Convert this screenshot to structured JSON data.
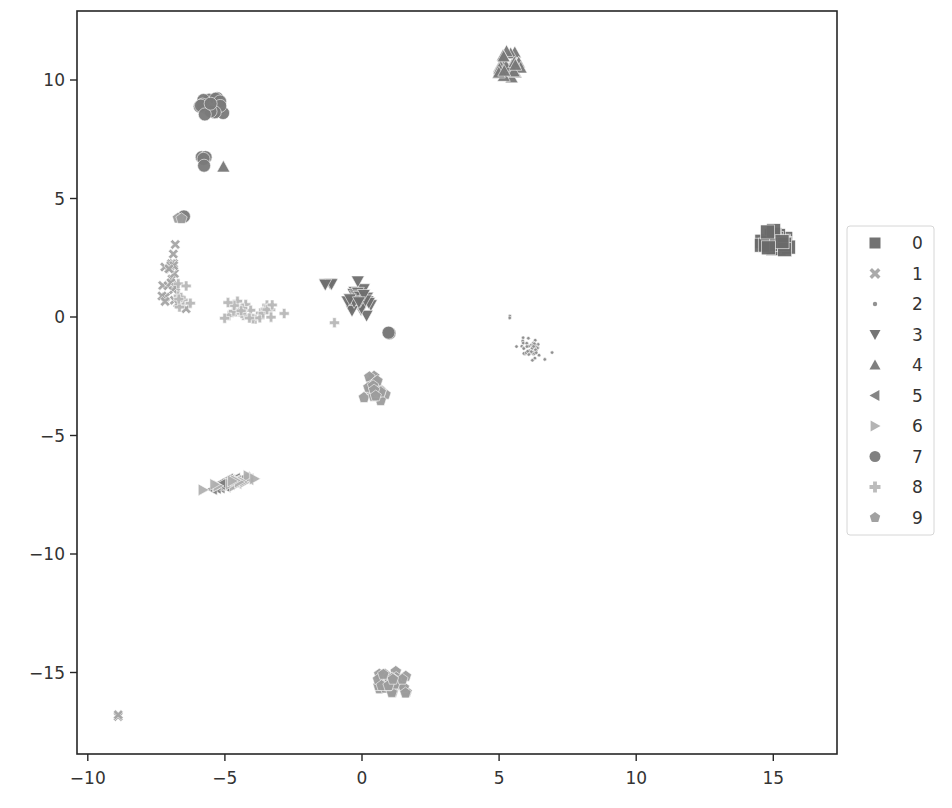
{
  "chart_data": {
    "type": "scatter",
    "title": "",
    "xlabel": "",
    "ylabel": "",
    "xlim": [
      -10.5,
      17.2
    ],
    "ylim": [
      -18.5,
      12.9
    ],
    "x_ticks": [
      -10,
      -5,
      0,
      5,
      10,
      15
    ],
    "x_tick_labels": [
      "−10",
      "−5",
      "0",
      "5",
      "10",
      "15"
    ],
    "y_ticks": [
      -15,
      -10,
      -5,
      0,
      5,
      10
    ],
    "y_tick_labels": [
      "−15",
      "−10",
      "−5",
      "0",
      "5",
      "10"
    ],
    "grid": false,
    "legend_position": "outside right, vertically centered",
    "legend": [
      {
        "label": "0",
        "marker": "square",
        "color": "#6a6a6a"
      },
      {
        "label": "1",
        "marker": "x",
        "color": "#a5a5a5"
      },
      {
        "label": "2",
        "marker": "dot",
        "color": "#8c8c8c"
      },
      {
        "label": "3",
        "marker": "triangle-down",
        "color": "#6e6e6e"
      },
      {
        "label": "4",
        "marker": "triangle-up",
        "color": "#787878"
      },
      {
        "label": "5",
        "marker": "triangle-left",
        "color": "#7e7e7e"
      },
      {
        "label": "6",
        "marker": "triangle-right",
        "color": "#b0b0b0"
      },
      {
        "label": "7",
        "marker": "circle",
        "color": "#7a7a7a"
      },
      {
        "label": "8",
        "marker": "plus",
        "color": "#b8b8b8"
      },
      {
        "label": "9",
        "marker": "pentagon",
        "color": "#9c9c9c"
      }
    ],
    "series": [
      {
        "name": "0",
        "clusters": [
          {
            "cx": 15.1,
            "cy": 3.1,
            "sx": 0.45,
            "sy": 0.38,
            "n": 30
          }
        ]
      },
      {
        "name": "1",
        "clusters": [
          {
            "cx": -7.0,
            "cy": 2.0,
            "sx": 0.35,
            "sy": 1.0,
            "n": 18
          },
          {
            "cx": -6.9,
            "cy": 0.6,
            "sx": 0.4,
            "sy": 0.25,
            "n": 8
          },
          {
            "cx": -8.9,
            "cy": -16.9,
            "sx": 0.08,
            "sy": 0.08,
            "n": 2
          }
        ]
      },
      {
        "name": "2",
        "clusters": [
          {
            "cx": 6.2,
            "cy": -1.3,
            "sx": 0.45,
            "sy": 0.35,
            "n": 45
          },
          {
            "cx": 5.5,
            "cy": 0.0,
            "sx": 0.1,
            "sy": 0.1,
            "n": 2
          }
        ]
      },
      {
        "name": "3",
        "clusters": [
          {
            "cx": -0.1,
            "cy": 0.7,
            "sx": 0.35,
            "sy": 0.5,
            "n": 30
          },
          {
            "cx": -1.2,
            "cy": 1.4,
            "sx": 0.2,
            "sy": 0.05,
            "n": 4
          }
        ]
      },
      {
        "name": "4",
        "clusters": [
          {
            "cx": 5.3,
            "cy": 10.6,
            "sx": 0.45,
            "sy": 0.45,
            "n": 32
          },
          {
            "cx": -5.1,
            "cy": 6.3,
            "sx": 0.05,
            "sy": 0.05,
            "n": 1
          }
        ]
      },
      {
        "name": "5",
        "clusters": [
          {
            "cx": -4.8,
            "cy": -7.0,
            "sx": 0.9,
            "sy": 0.12,
            "n": 30,
            "slope": 0.27
          }
        ]
      },
      {
        "name": "6",
        "clusters": [
          {
            "cx": -5.0,
            "cy": -7.1,
            "sx": 0.9,
            "sy": 0.12,
            "n": 14,
            "slope": 0.27
          }
        ]
      },
      {
        "name": "7",
        "clusters": [
          {
            "cx": -5.5,
            "cy": 8.9,
            "sx": 0.4,
            "sy": 0.45,
            "n": 24
          },
          {
            "cx": -5.8,
            "cy": 6.6,
            "sx": 0.12,
            "sy": 0.35,
            "n": 4
          },
          {
            "cx": -6.5,
            "cy": 4.3,
            "sx": 0.05,
            "sy": 0.05,
            "n": 1
          },
          {
            "cx": 1.0,
            "cy": -0.7,
            "sx": 0.05,
            "sy": 0.12,
            "n": 2
          }
        ]
      },
      {
        "name": "8",
        "clusters": [
          {
            "cx": -4.2,
            "cy": 0.3,
            "sx": 1.1,
            "sy": 0.35,
            "n": 28
          },
          {
            "cx": -6.6,
            "cy": 1.0,
            "sx": 0.3,
            "sy": 0.8,
            "n": 8
          },
          {
            "cx": -1.0,
            "cy": -0.3,
            "sx": 0.1,
            "sy": 0.1,
            "n": 1
          }
        ]
      },
      {
        "name": "9",
        "clusters": [
          {
            "cx": 0.4,
            "cy": -3.0,
            "sx": 0.3,
            "sy": 0.35,
            "n": 24
          },
          {
            "cx": 1.1,
            "cy": -15.4,
            "sx": 0.45,
            "sy": 0.35,
            "n": 38
          },
          {
            "cx": -6.6,
            "cy": 4.1,
            "sx": 0.1,
            "sy": 0.15,
            "n": 2
          }
        ]
      }
    ]
  },
  "layout": {
    "plot_left": 77,
    "plot_top": 11,
    "plot_right": 837,
    "plot_bottom": 754,
    "x0_px": 362,
    "x_px_per_unit": 27.42,
    "y0_px": 317,
    "y_px_per_unit": 23.7,
    "legend_box": {
      "x": 847,
      "y": 226,
      "w": 87,
      "h": 309
    }
  }
}
